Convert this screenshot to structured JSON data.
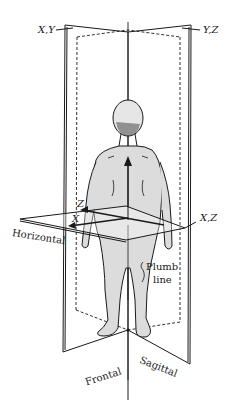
{
  "diagram": {
    "colors": {
      "ink": "#1a1a1a",
      "body_shade": "#d8d8d8",
      "background": "#ffffff"
    },
    "axis_labels": {
      "xy": "X,Y",
      "yz": "Y,Z",
      "xz": "X,Z",
      "z": "Z",
      "x": "X"
    },
    "plane_labels": {
      "horizontal": "Horizontal",
      "frontal": "Frontal",
      "sagittal": "Sagittal"
    },
    "plumb_line": {
      "line1": "Plumb",
      "line2": "line"
    }
  }
}
